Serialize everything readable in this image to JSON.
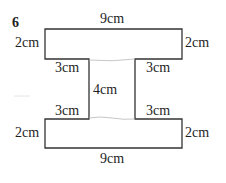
{
  "question_number": "6",
  "shape": {
    "type": "I-beam compound rectilinear shape",
    "stroke_color": "#333333",
    "seam_color": "#b8b8b8"
  },
  "labels": {
    "top_width": "9cm",
    "top_left_height": "2cm",
    "top_right_height": "2cm",
    "upper_left_overhang": "3cm",
    "upper_right_overhang": "3cm",
    "stem_height": "4cm",
    "lower_left_overhang": "3cm",
    "lower_right_overhang": "3cm",
    "bottom_left_height": "2cm",
    "bottom_right_height": "2cm",
    "bottom_width": "9cm"
  }
}
